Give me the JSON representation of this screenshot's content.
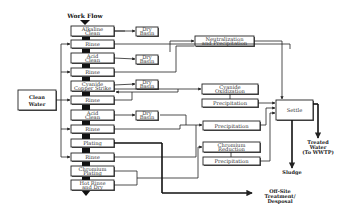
{
  "title": "Work Flow",
  "process_steps": [
    {
      "id": "alkaline-clean",
      "lines": [
        "Alkaline",
        "Clean"
      ]
    },
    {
      "id": "rinse-1",
      "lines": [
        "Rinse"
      ]
    },
    {
      "id": "acid-clean-1",
      "lines": [
        "Acid",
        "Clean"
      ]
    },
    {
      "id": "rinse-2",
      "lines": [
        "Rinse"
      ]
    },
    {
      "id": "cyanide-copper-strike",
      "lines": [
        "Cyanide",
        "Copper Strike"
      ]
    },
    {
      "id": "rinse-3",
      "lines": [
        "Rinse"
      ]
    },
    {
      "id": "acid-clean-2",
      "lines": [
        "Acid",
        "Clean"
      ]
    },
    {
      "id": "rinse-4",
      "lines": [
        "Rinse"
      ]
    },
    {
      "id": "plating",
      "lines": [
        "Plating"
      ]
    },
    {
      "id": "rinse-5",
      "lines": [
        "Rinse"
      ]
    },
    {
      "id": "chromium-plating",
      "lines": [
        "Chromium",
        "Plating"
      ]
    },
    {
      "id": "hot-rinse-dry",
      "lines": [
        "Hot Rinse",
        "and Dry"
      ]
    }
  ],
  "dry_basin": {
    "lines": [
      "Dry",
      "Basin"
    ]
  },
  "clean_water": {
    "lines": [
      "Clean",
      "Water"
    ]
  },
  "treatment": {
    "neutralization": {
      "lines": [
        "Neutralization",
        "and Precipitation"
      ]
    },
    "cyanide_oxidization": {
      "lines": [
        "Cyanide",
        "Oxidization"
      ]
    },
    "precipitation_1": {
      "lines": [
        "Precipitation"
      ]
    },
    "precipitation_2": {
      "lines": [
        "Precipitation"
      ]
    },
    "chromium_reduction": {
      "lines": [
        "Chromium",
        "Reduction"
      ]
    },
    "precipitation_3": {
      "lines": [
        "Precipitation"
      ]
    },
    "settle": {
      "lines": [
        "Settle"
      ]
    }
  },
  "outputs": {
    "treated_water": {
      "lines": [
        "Treated",
        "Water",
        "(To WWTP)"
      ]
    },
    "sludge": {
      "lines": [
        "Sludge"
      ]
    },
    "offsite": {
      "lines": [
        "Off-Site",
        "Treatment/",
        "Desposal"
      ]
    }
  }
}
